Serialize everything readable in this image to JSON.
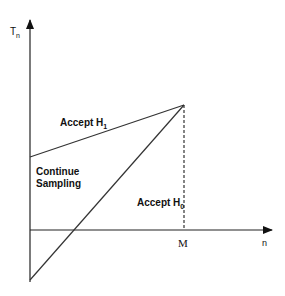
{
  "diagram": {
    "y_axis_label": "T",
    "y_axis_sub": "n",
    "x_axis_label": "n",
    "x_tick_label": "M",
    "regions": {
      "accept_h1": {
        "text": "Accept H",
        "sub": "1"
      },
      "continue_1": "Continue",
      "continue_2": "Sampling",
      "accept_h0": {
        "text": "Accept H",
        "sub": "0"
      }
    },
    "colors": {
      "line": "#333333",
      "axis": "#222222"
    }
  }
}
